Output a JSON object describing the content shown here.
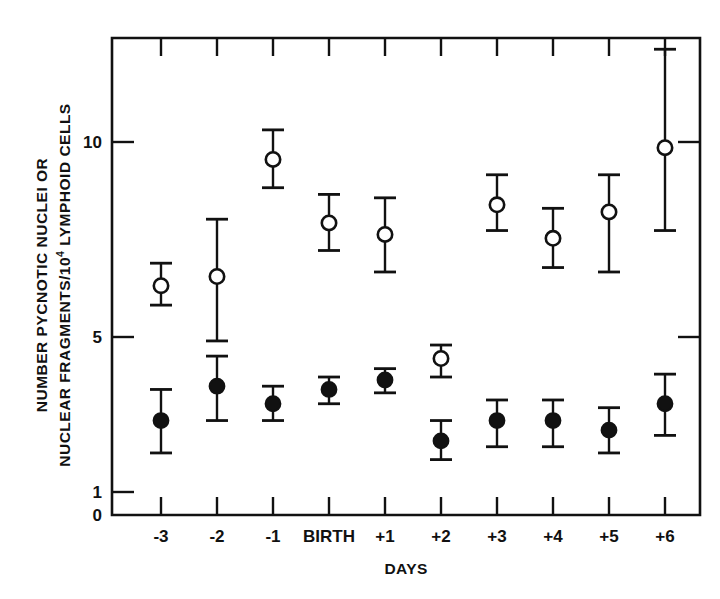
{
  "chart_data": {
    "type": "scatter",
    "title": "",
    "subtitle": "",
    "xlabel": "DAYS",
    "ylabel_line1": "NUMBER PYCNOTIC NUCLEI OR",
    "ylabel_line2_pre": "NUCLEAR FRAGMENTS/10",
    "ylabel_line2_sup": "4",
    "ylabel_line2_post": " LYMPHOID CELLS",
    "yscale": "log",
    "grid": false,
    "legend": "none",
    "x_tick_labels": [
      "-3",
      "-2",
      "-1",
      "BIRTH",
      "+1",
      "+2",
      "+3",
      "+4",
      "+5",
      "+6"
    ],
    "y_tick_labels": [
      "0",
      "1",
      "5",
      "10"
    ],
    "y_tick_values": [
      0,
      1,
      5,
      10
    ],
    "ylim": [
      0,
      14
    ],
    "categories": [
      "-3",
      "-2",
      "-1",
      "BIRTH",
      "+1",
      "+2",
      "+3",
      "+4",
      "+5",
      "+6"
    ],
    "series": [
      {
        "name": "open-circles",
        "marker": "open-circle",
        "values": [
          6.0,
          6.2,
          9.4,
          7.5,
          7.2,
          4.0,
          8.0,
          7.1,
          7.8,
          9.8
        ],
        "err_low": [
          5.6,
          4.8,
          8.5,
          6.8,
          6.3,
          3.3,
          7.3,
          6.4,
          6.3,
          7.3
        ],
        "err_high": [
          6.5,
          7.6,
          10.4,
          8.3,
          8.2,
          4.6,
          8.9,
          7.9,
          8.9,
          13.5
        ]
      },
      {
        "name": "filled-circles",
        "marker": "filled-circle",
        "values": [
          2.1,
          3.0,
          2.5,
          2.9,
          3.2,
          1.7,
          2.1,
          2.1,
          1.9,
          2.5
        ],
        "err_low": [
          1.5,
          2.1,
          2.1,
          2.5,
          2.8,
          1.4,
          1.6,
          1.6,
          1.5,
          1.8
        ],
        "err_high": [
          2.9,
          4.1,
          3.0,
          3.3,
          3.6,
          2.1,
          2.6,
          2.6,
          2.4,
          3.4
        ]
      }
    ]
  },
  "colors": {
    "ink": "#111111",
    "paper": "#ffffff"
  }
}
